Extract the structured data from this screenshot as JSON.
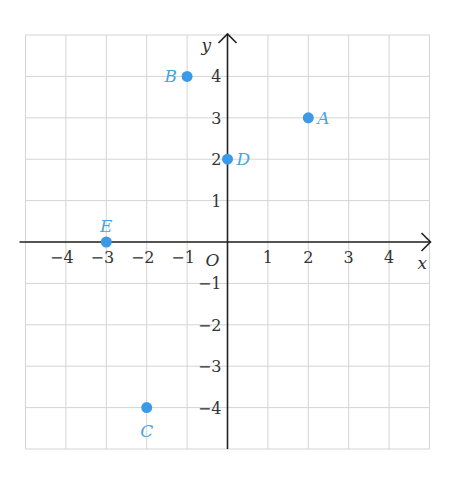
{
  "chart_data": {
    "type": "scatter",
    "title": "",
    "xlabel": "x",
    "ylabel": "y",
    "origin_label": "O",
    "xlim": [
      -5,
      5
    ],
    "ylim": [
      -5,
      5
    ],
    "grid": true,
    "x_ticks": [
      -4,
      -3,
      -2,
      -1,
      1,
      2,
      3,
      4
    ],
    "y_ticks": [
      4,
      3,
      2,
      1,
      -1,
      -2,
      -3,
      -4
    ],
    "x_tick_labels": [
      "−4",
      "−3",
      "−2",
      "−1",
      "1",
      "2",
      "3",
      "4"
    ],
    "y_tick_labels": [
      "4",
      "3",
      "2",
      "1",
      "−1",
      "−2",
      "−3",
      "−4"
    ],
    "points": [
      {
        "label": "A",
        "x": 2,
        "y": 3,
        "label_pos": "right"
      },
      {
        "label": "B",
        "x": -1,
        "y": 4,
        "label_pos": "left"
      },
      {
        "label": "C",
        "x": -2,
        "y": -4,
        "label_pos": "below"
      },
      {
        "label": "D",
        "x": 0,
        "y": 2,
        "label_pos": "right"
      },
      {
        "label": "E",
        "x": -3,
        "y": 0,
        "label_pos": "above"
      }
    ],
    "colors": {
      "point": "#3a9ae8",
      "point_label": "#4aa3df",
      "axis": "#222222",
      "grid": "#d4d4d4",
      "tick_text": "#333333"
    }
  }
}
